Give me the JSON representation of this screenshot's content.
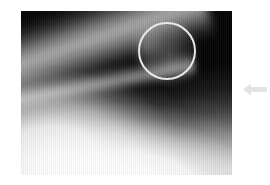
{
  "figure": {
    "type": "radiograph",
    "modality_label": "X-ray",
    "caption": "",
    "canvas": {
      "width": 270,
      "height": 185,
      "background_color": "#ffffff"
    }
  },
  "radiograph": {
    "name": "grayscale-radiograph",
    "alt_text": "Grayscale lateral radiograph showing a bright curved bone cortex sweeping from the lower left toward the upper right against a dark background.",
    "frame": {
      "x": 21,
      "y": 11,
      "width": 211,
      "height": 164
    },
    "background_color": "#050505",
    "bright_tissue_color": "#ffffff",
    "tone_description": "dark upper field with bright soft-tissue dome at lower left and a bright oblique cortical ridge"
  },
  "annotations": {
    "circle": {
      "name": "region-of-interest-circle",
      "shape": "circle",
      "stroke_color": "#e8e8e8",
      "stroke_width": 2,
      "center": {
        "x": 167,
        "y": 51
      },
      "radius": 29,
      "label": ""
    },
    "arrow": {
      "name": "pointer-arrow",
      "shape": "arrow",
      "direction": "left",
      "fill_color": "#e3e3e3",
      "position": {
        "x": 243,
        "y": 82
      },
      "width": 24,
      "height": 15,
      "label": ""
    }
  }
}
